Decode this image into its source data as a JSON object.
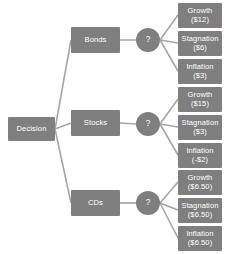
{
  "diagram": {
    "type": "decision-tree",
    "colors": {
      "node_fill": "#7f7f7f",
      "node_text": "#ffffff",
      "edge": "#a6a6a6",
      "background": "#ffffff"
    },
    "root": {
      "label": "Decision",
      "x": 8,
      "y": 117,
      "w": 47,
      "h": 24
    },
    "branches": [
      {
        "id": "bonds",
        "label": "Bonds",
        "x": 71,
        "y": 27,
        "w": 49,
        "h": 26,
        "chance": {
          "label": "?",
          "cx": 148,
          "cy": 40,
          "r": 12
        },
        "outcomes": [
          {
            "id": "bonds-growth",
            "name": "Growth",
            "value": "($12)",
            "x": 178,
            "y": 3,
            "w": 44,
            "h": 25
          },
          {
            "id": "bonds-stagnation",
            "name": "Stagnation",
            "value": "($6)",
            "x": 178,
            "y": 31,
            "w": 44,
            "h": 25
          },
          {
            "id": "bonds-inflation",
            "name": "Inflation",
            "value": "($3)",
            "x": 178,
            "y": 59,
            "w": 44,
            "h": 25
          }
        ]
      },
      {
        "id": "stocks",
        "label": "Stocks",
        "x": 71,
        "y": 110,
        "w": 49,
        "h": 26,
        "chance": {
          "label": "?",
          "cx": 148,
          "cy": 124,
          "r": 12
        },
        "outcomes": [
          {
            "id": "stocks-growth",
            "name": "Growth",
            "value": "($15)",
            "x": 178,
            "y": 87,
            "w": 44,
            "h": 25
          },
          {
            "id": "stocks-stagnation",
            "name": "Stagnation",
            "value": "($3)",
            "x": 178,
            "y": 115,
            "w": 44,
            "h": 25
          },
          {
            "id": "stocks-inflation",
            "name": "Inflation",
            "value": "(-$2)",
            "x": 178,
            "y": 143,
            "w": 44,
            "h": 25
          }
        ]
      },
      {
        "id": "cds",
        "label": "CDs",
        "x": 71,
        "y": 190,
        "w": 49,
        "h": 26,
        "chance": {
          "label": "?",
          "cx": 148,
          "cy": 203,
          "r": 12
        },
        "outcomes": [
          {
            "id": "cds-growth",
            "name": "Growth",
            "value": "($6.50)",
            "x": 178,
            "y": 170,
            "w": 44,
            "h": 25
          },
          {
            "id": "cds-stagnation",
            "name": "Stagnation",
            "value": "($6.50)",
            "x": 178,
            "y": 198,
            "w": 44,
            "h": 25
          },
          {
            "id": "cds-inflation",
            "name": "Inflation",
            "value": "($6.50)",
            "x": 178,
            "y": 226,
            "w": 44,
            "h": 25
          }
        ]
      }
    ],
    "edges": [
      {
        "from": "root",
        "to": "bonds",
        "x1": 55,
        "y1": 129,
        "x2": 71,
        "y2": 40
      },
      {
        "from": "root",
        "to": "stocks",
        "x1": 55,
        "y1": 129,
        "x2": 71,
        "y2": 123
      },
      {
        "from": "root",
        "to": "cds",
        "x1": 55,
        "y1": 129,
        "x2": 71,
        "y2": 203
      },
      {
        "from": "bonds",
        "to": "bonds-chance",
        "x1": 120,
        "y1": 40,
        "x2": 136,
        "y2": 40
      },
      {
        "from": "stocks",
        "to": "stocks-chance",
        "x1": 120,
        "y1": 123,
        "x2": 136,
        "y2": 124
      },
      {
        "from": "cds",
        "to": "cds-chance",
        "x1": 120,
        "y1": 203,
        "x2": 136,
        "y2": 203
      },
      {
        "from": "bonds-chance",
        "to": "bonds-growth",
        "x1": 160,
        "y1": 40,
        "x2": 178,
        "y2": 15
      },
      {
        "from": "bonds-chance",
        "to": "bonds-stagnation",
        "x1": 160,
        "y1": 40,
        "x2": 178,
        "y2": 43
      },
      {
        "from": "bonds-chance",
        "to": "bonds-inflation",
        "x1": 160,
        "y1": 40,
        "x2": 178,
        "y2": 71
      },
      {
        "from": "stocks-chance",
        "to": "stocks-growth",
        "x1": 160,
        "y1": 124,
        "x2": 178,
        "y2": 99
      },
      {
        "from": "stocks-chance",
        "to": "stocks-stagnation",
        "x1": 160,
        "y1": 124,
        "x2": 178,
        "y2": 127
      },
      {
        "from": "stocks-chance",
        "to": "stocks-inflation",
        "x1": 160,
        "y1": 124,
        "x2": 178,
        "y2": 155
      },
      {
        "from": "cds-chance",
        "to": "cds-growth",
        "x1": 160,
        "y1": 203,
        "x2": 178,
        "y2": 182
      },
      {
        "from": "cds-chance",
        "to": "cds-stagnation",
        "x1": 160,
        "y1": 203,
        "x2": 178,
        "y2": 210
      },
      {
        "from": "cds-chance",
        "to": "cds-inflation",
        "x1": 160,
        "y1": 203,
        "x2": 178,
        "y2": 238
      }
    ]
  }
}
